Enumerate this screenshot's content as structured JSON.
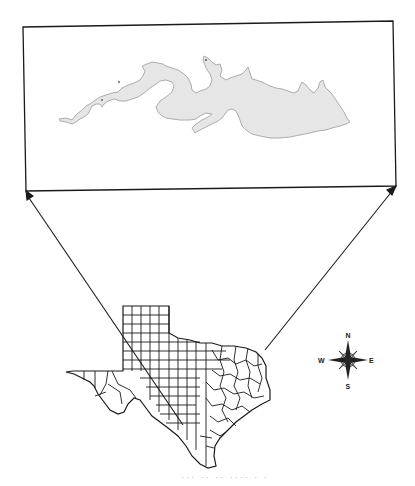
{
  "figure": {
    "inset": {
      "subject": "reservoir-outline",
      "fill_color": "#e6e6e6",
      "outline_color": "#9a9a9a",
      "frame_color": "#1a1a1a"
    },
    "locator_map": {
      "subject": "texas-county-map",
      "line_color": "#1a1a1a"
    },
    "compass": {
      "north": "N",
      "south": "S",
      "east": "E",
      "west": "W"
    },
    "caption": "··· ·· ·· ···· · ·"
  }
}
